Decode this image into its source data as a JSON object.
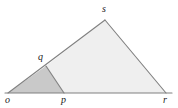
{
  "figure": {
    "type": "geometry-diagram",
    "background_color": "#ffffff",
    "stroke_color": "#808080",
    "label_color": "#1a1a1a",
    "canvas": {
      "width": 178,
      "height": 108
    },
    "points": {
      "o": {
        "x": 8,
        "y": 93
      },
      "p": {
        "x": 64,
        "y": 93
      },
      "r": {
        "x": 166,
        "y": 93
      },
      "q": {
        "x": 46,
        "y": 66
      },
      "s": {
        "x": 105,
        "y": 20
      }
    },
    "baseline": {
      "x_start": 5,
      "x_end": 172,
      "y": 93
    },
    "regions": [
      {
        "name": "triangle-oqp",
        "polygon": "o,q,p",
        "fill": "#c9c9c9"
      },
      {
        "name": "quadrilateral-qsrp",
        "polygon": "q,s,r,p",
        "fill": "#efefef"
      }
    ],
    "segments": [
      {
        "name": "segment-os",
        "from": "o",
        "to": "s"
      },
      {
        "name": "segment-sr",
        "from": "s",
        "to": "r"
      },
      {
        "name": "segment-or",
        "from": "o",
        "to": "r"
      },
      {
        "name": "segment-qp",
        "from": "q",
        "to": "p"
      }
    ],
    "labels": [
      {
        "key": "o",
        "text": "o",
        "x": 5,
        "y": 95
      },
      {
        "key": "p",
        "text": "p",
        "x": 61,
        "y": 95
      },
      {
        "key": "r",
        "text": "r",
        "x": 163,
        "y": 95
      },
      {
        "key": "q",
        "text": "q",
        "x": 38,
        "y": 52
      },
      {
        "key": "s",
        "text": "s",
        "x": 102,
        "y": 4
      }
    ]
  }
}
